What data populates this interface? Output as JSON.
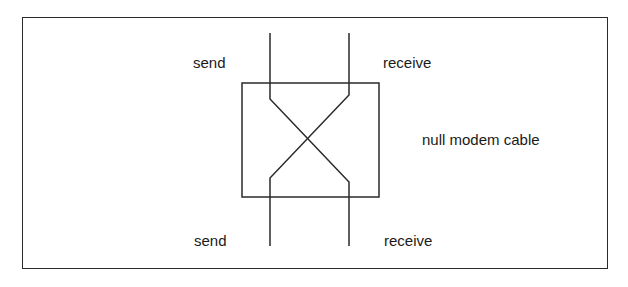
{
  "diagram": {
    "type": "null-modem-wiring",
    "labels": {
      "top_left": "send",
      "top_right": "receive",
      "bottom_left": "send",
      "bottom_right": "receive",
      "cable": "null modem cable"
    },
    "colors": {
      "line": "#2a2a2a",
      "text": "#1a1a1a",
      "background": "#ffffff"
    }
  }
}
